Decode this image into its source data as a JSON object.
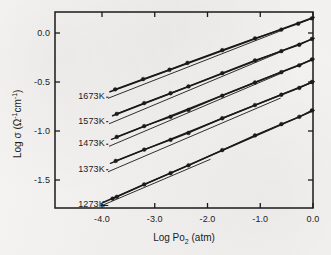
{
  "chart_data": {
    "type": "scatter",
    "title": "",
    "xlabel": "Log Po2 (atm)",
    "xlabel_parts": {
      "pre": "Log Po",
      "sub": "2",
      "post": " (atm)"
    },
    "ylabel": "Log σ (Ω⁻¹cm⁻¹)",
    "ylabel_parts": {
      "pre": "Log σ (Ω",
      "sup1": "-1",
      "mid": "cm",
      "sup2": "-1",
      "post": ")"
    },
    "xlim": [
      -4.6,
      0.3
    ],
    "ylim": [
      -1.85,
      0.28
    ],
    "xticks": [
      "-4.0",
      "-3.0",
      "-2.0",
      "-1.0",
      "0.0"
    ],
    "xtick_values": [
      -4.0,
      -3.0,
      -2.0,
      -1.0,
      0.0
    ],
    "yticks": [
      "0.0",
      "-0.5",
      "-1.0",
      "-1.5"
    ],
    "ytick_values": [
      0.0,
      -0.5,
      -1.0,
      -1.5
    ],
    "grid": false,
    "legend_position": "inline-left",
    "marker": "filled-circle",
    "marker_color": "#1a1a1a",
    "line_color": "#1a1a1a",
    "guide_line_color": "#1a1a1a",
    "series": [
      {
        "name": "1673K",
        "label": "1673K",
        "label_x": -4.45,
        "label_y": -0.655,
        "leader_to_x": -3.92,
        "leader_to_y": -0.655,
        "fit": {
          "x0": -3.85,
          "y0": -0.6,
          "x1": 0.02,
          "y1": 0.16
        },
        "guide": {
          "x0": -3.88,
          "y0": -0.665,
          "x1": -0.6,
          "y1": 0.025
        },
        "x": [
          -3.75,
          -3.22,
          -2.72,
          -2.38,
          -1.72,
          -1.1,
          -0.6,
          -0.28,
          -0.02
        ],
        "y": [
          -0.575,
          -0.47,
          -0.375,
          -0.305,
          -0.175,
          -0.055,
          0.035,
          0.095,
          0.15
        ]
      },
      {
        "name": "1573K",
        "label": "1573K",
        "label_x": -4.45,
        "label_y": -0.905,
        "leader_to_x": -3.92,
        "leader_to_y": -0.905,
        "fit": {
          "x0": -3.8,
          "y0": -0.845,
          "x1": 0.02,
          "y1": -0.055
        },
        "guide": {
          "x0": -3.86,
          "y0": -0.925,
          "x1": -0.62,
          "y1": -0.195
        },
        "x": [
          -3.72,
          -3.2,
          -2.7,
          -2.36,
          -1.72,
          -1.1,
          -0.6,
          -0.26,
          -0.02
        ],
        "y": [
          -0.825,
          -0.715,
          -0.615,
          -0.545,
          -0.41,
          -0.28,
          -0.185,
          -0.12,
          -0.06
        ]
      },
      {
        "name": "1473K",
        "label": "1473K",
        "label_x": -4.45,
        "label_y": -1.135,
        "leader_to_x": -3.92,
        "leader_to_y": -1.135,
        "fit": {
          "x0": -3.82,
          "y0": -1.085,
          "x1": 0.02,
          "y1": -0.265
        },
        "guide": {
          "x0": -3.86,
          "y0": -1.155,
          "x1": -0.62,
          "y1": -0.415
        },
        "x": [
          -3.72,
          -3.2,
          -2.7,
          -2.36,
          -1.72,
          -1.1,
          -0.6,
          -0.26,
          -0.02
        ],
        "y": [
          -1.06,
          -0.95,
          -0.855,
          -0.785,
          -0.64,
          -0.505,
          -0.4,
          -0.33,
          -0.27
        ]
      },
      {
        "name": "1373K",
        "label": "1373K",
        "label_x": -4.45,
        "label_y": -1.395,
        "leader_to_x": -3.92,
        "leader_to_y": -1.395,
        "fit": {
          "x0": -3.84,
          "y0": -1.33,
          "x1": 0.02,
          "y1": -0.495
        },
        "guide": {
          "x0": -3.88,
          "y0": -1.415,
          "x1": -0.62,
          "y1": -0.665
        },
        "x": [
          -3.74,
          -3.2,
          -2.7,
          -2.36,
          -1.72,
          -1.1,
          -0.6,
          -0.26,
          -0.02
        ],
        "y": [
          -1.305,
          -1.19,
          -1.09,
          -1.02,
          -0.87,
          -0.735,
          -0.63,
          -0.56,
          -0.5
        ]
      },
      {
        "name": "1273K",
        "label": "1273K",
        "label_x": -4.45,
        "label_y": -1.76,
        "leader_to_x": -4.03,
        "leader_to_y": -1.76,
        "fit": {
          "x0": -3.98,
          "y0": -1.73,
          "x1": 0.02,
          "y1": -0.79
        },
        "guide": {
          "x0": -4.0,
          "y0": -1.76,
          "x1": -1.95,
          "y1": -1.29
        },
        "x": [
          -3.8,
          -3.72,
          -3.2,
          -2.7,
          -2.36,
          -1.72,
          -1.1,
          -0.6,
          -0.26,
          -0.02
        ],
        "y": [
          -1.69,
          -1.672,
          -1.545,
          -1.43,
          -1.35,
          -1.195,
          -1.045,
          -0.93,
          -0.855,
          -0.79
        ]
      }
    ]
  }
}
